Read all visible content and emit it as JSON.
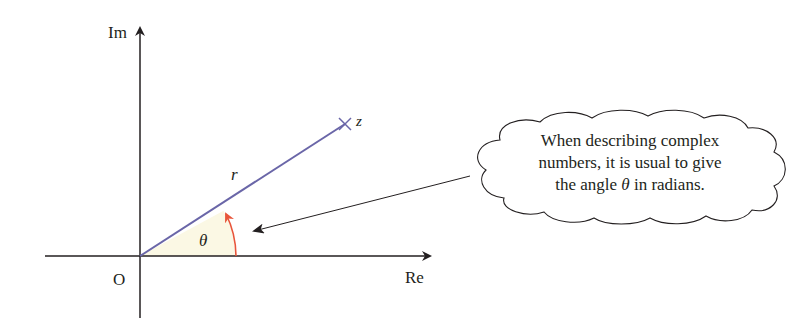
{
  "diagram": {
    "axes": {
      "imaginary_label": "Im",
      "real_label": "Re",
      "origin_label": "O"
    },
    "point": {
      "label": "z",
      "marker": "cross"
    },
    "modulus_label": "r",
    "angle_label": "θ",
    "colors": {
      "axes": "#231f20",
      "radius_line": "#6a66a8",
      "angle_arc": "#e8553a",
      "sector_fill": "#fbf8e4",
      "text": "#231f20"
    },
    "callout": {
      "line1": "When describing complex",
      "line2": "numbers, it is usual to give",
      "line3_prefix": "the angle ",
      "line3_symbol": "θ",
      "line3_suffix": " in radians."
    }
  }
}
